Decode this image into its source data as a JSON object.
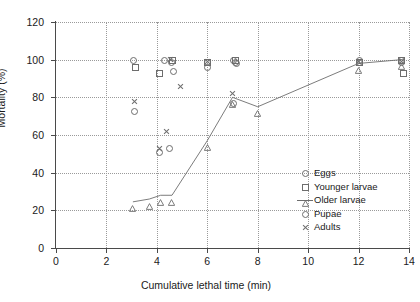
{
  "chart_data": {
    "type": "scatter",
    "title": "",
    "xlabel": "Cumulative lethal time (min)",
    "ylabel": "Mortality (%)",
    "xlim": [
      0,
      14
    ],
    "ylim": [
      0,
      120
    ],
    "xticks": [
      0,
      2,
      4,
      6,
      8,
      10,
      12,
      14
    ],
    "yticks": [
      0,
      20,
      40,
      60,
      80,
      100,
      120
    ],
    "grid": true,
    "legend_position": "inside-lower-right",
    "series": [
      {
        "name": "Eggs",
        "marker": "circle",
        "line": false,
        "points": [
          {
            "x": 3.05,
            "y": 100
          },
          {
            "x": 4.3,
            "y": 100
          },
          {
            "x": 4.55,
            "y": 99
          },
          {
            "x": 6.0,
            "y": 99
          },
          {
            "x": 7.0,
            "y": 100
          },
          {
            "x": 7.1,
            "y": 99
          },
          {
            "x": 12.0,
            "y": 100
          },
          {
            "x": 13.7,
            "y": 100
          }
        ]
      },
      {
        "name": "Younger larvae",
        "marker": "square",
        "line": false,
        "points": [
          {
            "x": 3.15,
            "y": 96
          },
          {
            "x": 4.1,
            "y": 93
          },
          {
            "x": 4.6,
            "y": 100
          },
          {
            "x": 6.0,
            "y": 99
          },
          {
            "x": 7.1,
            "y": 100
          },
          {
            "x": 12.0,
            "y": 99
          },
          {
            "x": 13.7,
            "y": 100
          },
          {
            "x": 13.75,
            "y": 93
          }
        ]
      },
      {
        "name": "Older larvae",
        "marker": "triangle",
        "line": true,
        "points": [
          {
            "x": 3.05,
            "y": 24.5
          },
          {
            "x": 3.7,
            "y": 26
          },
          {
            "x": 4.15,
            "y": 28
          },
          {
            "x": 4.6,
            "y": 28
          },
          {
            "x": 6.0,
            "y": 57
          },
          {
            "x": 7.0,
            "y": 80
          },
          {
            "x": 8.0,
            "y": 75
          },
          {
            "x": 12.0,
            "y": 98
          },
          {
            "x": 13.7,
            "y": 100
          }
        ]
      },
      {
        "name": "Pupae",
        "marker": "circle",
        "line": false,
        "points": [
          {
            "x": 3.1,
            "y": 73
          },
          {
            "x": 4.1,
            "y": 51
          },
          {
            "x": 4.5,
            "y": 53
          },
          {
            "x": 4.65,
            "y": 94
          },
          {
            "x": 6.0,
            "y": 96
          },
          {
            "x": 7.0,
            "y": 77
          },
          {
            "x": 7.15,
            "y": 98
          },
          {
            "x": 12.0,
            "y": 99
          },
          {
            "x": 13.7,
            "y": 99
          }
        ]
      },
      {
        "name": "Adults",
        "marker": "cross",
        "line": false,
        "points": [
          {
            "x": 3.1,
            "y": 78
          },
          {
            "x": 4.1,
            "y": 53
          },
          {
            "x": 4.4,
            "y": 62
          },
          {
            "x": 4.55,
            "y": 100
          },
          {
            "x": 4.95,
            "y": 86
          },
          {
            "x": 6.0,
            "y": 99
          },
          {
            "x": 7.0,
            "y": 82
          },
          {
            "x": 12.0,
            "y": 99
          },
          {
            "x": 13.7,
            "y": 99
          }
        ]
      }
    ]
  },
  "legend": {
    "items": [
      {
        "label": "Eggs",
        "marker": "circle",
        "line": false
      },
      {
        "label": "Younger larvae",
        "marker": "square",
        "line": false
      },
      {
        "label": "Older larvae",
        "marker": "triangle",
        "line": true
      },
      {
        "label": "Pupae",
        "marker": "circle",
        "line": false
      },
      {
        "label": "Adults",
        "marker": "cross",
        "line": false
      }
    ]
  },
  "colors": {
    "marker": "#6d6d6d",
    "axis": "#4a4a4a",
    "grid": "#9a9a9a",
    "text": "#1a1a1a",
    "background": "#ffffff"
  }
}
